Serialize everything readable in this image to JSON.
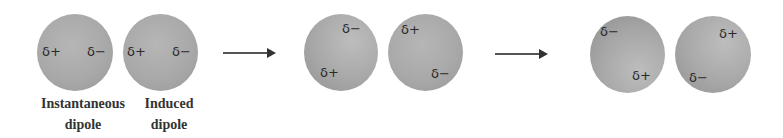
{
  "diagram": {
    "colors": {
      "atom_fill": "#a9a9a9",
      "text": "#2a2a2a",
      "arrow": "#444444"
    },
    "stages": [
      {
        "atoms": [
          {
            "charges": [
              "δ+",
              "δ−"
            ],
            "label_line1": "Instantaneous",
            "label_line2": "dipole"
          },
          {
            "charges": [
              "δ+",
              "δ−"
            ],
            "label_line1": "Induced",
            "label_line2": "dipole"
          }
        ]
      },
      {
        "atoms": [
          {
            "charges": [
              "δ−",
              "δ+"
            ]
          },
          {
            "charges": [
              "δ+",
              "δ−"
            ]
          }
        ]
      },
      {
        "atoms": [
          {
            "charges": [
              "δ−",
              "δ+"
            ]
          },
          {
            "charges": [
              "δ+",
              "δ−"
            ]
          }
        ]
      }
    ],
    "arrows": [
      {
        "direction": "right-arrow"
      },
      {
        "direction": "right-arrow"
      }
    ]
  }
}
